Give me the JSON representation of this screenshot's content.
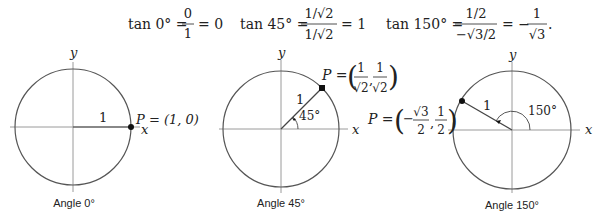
{
  "equations": {
    "tan0": {
      "lhs": "tan 0° =",
      "num": "0",
      "den": "1",
      "rhs": "= 0"
    },
    "tan45": {
      "lhs": "tan 45° =",
      "num": "1/√2",
      "den": "1/√2",
      "rhs": "= 1"
    },
    "tan150": {
      "lhs": "tan 150° =",
      "num": "1/2",
      "den": "−√3/2",
      "mid": "= −",
      "num2": "1",
      "den2": "√3",
      "end": "."
    }
  },
  "diagrams": [
    {
      "caption": "Angle 0°",
      "x_label": "x",
      "y_label": "y",
      "radius_label": "1",
      "point_label": "P = (1, 0)",
      "angle_deg": 0
    },
    {
      "caption": "Angle 45°",
      "x_label": "x",
      "y_label": "y",
      "radius_label": "1",
      "angle_label": "45°",
      "point_label_prefix": "P =",
      "point_coords": [
        "1/√2",
        "1/√2"
      ],
      "angle_deg": 45
    },
    {
      "caption": "Angle 150°",
      "x_label": "x",
      "y_label": "y",
      "radius_label": "1",
      "angle_label": "150°",
      "point_label_prefix": "P =",
      "point_coords": [
        "−√3/2",
        "1/2"
      ],
      "angle_deg": 150
    }
  ]
}
